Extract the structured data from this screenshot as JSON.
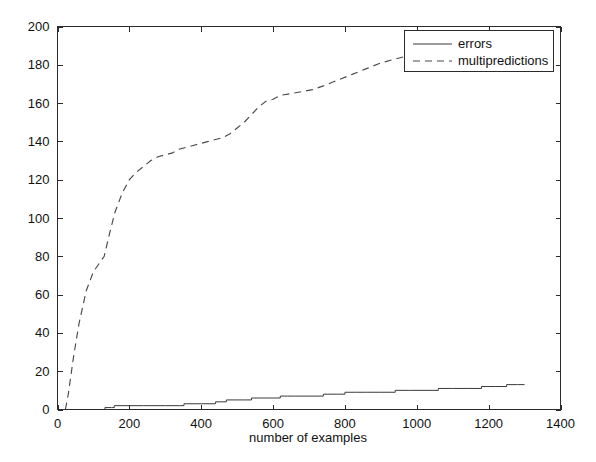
{
  "chart_data": {
    "type": "line",
    "title": "",
    "xlabel": "number of examples",
    "ylabel": "",
    "xlim": [
      0,
      1400
    ],
    "ylim": [
      0,
      200
    ],
    "xticks": [
      0,
      200,
      400,
      600,
      800,
      1000,
      1200,
      1400
    ],
    "yticks": [
      0,
      20,
      40,
      60,
      80,
      100,
      120,
      140,
      160,
      180,
      200
    ],
    "xtick_labels": [
      "0",
      "200",
      "400",
      "600",
      "800",
      "1000",
      "1200",
      "1400"
    ],
    "ytick_labels": [
      "0",
      "20",
      "40",
      "60",
      "80",
      "100",
      "120",
      "140",
      "160",
      "180",
      "200"
    ],
    "grid": false,
    "legend_position": "upper right",
    "frame": true,
    "tick_direction": "in",
    "series": [
      {
        "name": "errors",
        "style": "solid",
        "color": "#3a3a3a",
        "x": [
          20,
          60,
          100,
          125,
          132,
          150,
          158,
          200,
          240,
          252,
          300,
          340,
          352,
          360,
          400,
          430,
          440,
          452,
          470,
          480,
          500,
          520,
          540,
          560,
          580,
          600,
          620,
          640,
          660,
          700,
          740,
          780,
          800,
          830,
          860,
          900,
          940,
          980,
          1020,
          1060,
          1100,
          1140,
          1180,
          1220,
          1250,
          1280,
          1300
        ],
        "y": [
          0,
          0,
          0,
          0,
          1,
          1,
          2,
          2,
          2,
          2,
          2,
          2,
          3,
          3,
          3,
          3,
          4,
          4,
          5,
          5,
          5,
          5,
          6,
          6,
          6,
          6,
          7,
          7,
          7,
          7,
          8,
          8,
          9,
          9,
          9,
          9,
          10,
          10,
          10,
          11,
          11,
          11,
          12,
          12,
          13,
          13,
          13
        ]
      },
      {
        "name": "multipredictions",
        "style": "dashed",
        "color": "#4a4a4a",
        "x": [
          22,
          30,
          45,
          60,
          80,
          100,
          115,
          130,
          145,
          160,
          180,
          200,
          220,
          240,
          260,
          280,
          300,
          320,
          340,
          360,
          380,
          400,
          420,
          440,
          460,
          480,
          500,
          520,
          540,
          560,
          580,
          600,
          610,
          620,
          650,
          680,
          710,
          740,
          780,
          820,
          860,
          900,
          940,
          980,
          1000
        ],
        "y": [
          0,
          8,
          28,
          45,
          62,
          72,
          76,
          80,
          92,
          103,
          113,
          120,
          124,
          127,
          130,
          132,
          133,
          134,
          136,
          137,
          138,
          139,
          140,
          141,
          142,
          144,
          147,
          150,
          154,
          158,
          161,
          162,
          163,
          164,
          165,
          166,
          167,
          169,
          172,
          175,
          178,
          181,
          183,
          185,
          186
        ]
      }
    ],
    "legend_entries": [
      {
        "label": "errors",
        "style": "solid"
      },
      {
        "label": "multipredictions",
        "style": "dashed"
      }
    ]
  },
  "figure": {
    "background_color": "#ffffff",
    "axis_color": "#2b2b2b"
  }
}
